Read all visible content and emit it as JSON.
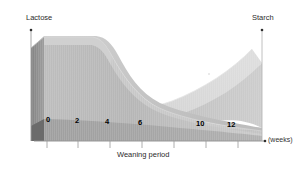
{
  "chart_data": {
    "type": "area",
    "title": "",
    "subtitle": "",
    "xlabel": "Weaning period",
    "xunit": "(weeks)",
    "ylabel_left": "Lactose",
    "ylabel_right": "Starch",
    "grid": false,
    "legend_position": "none",
    "xlim": [
      0,
      14
    ],
    "ylim": [
      0,
      100
    ],
    "x_ticks": [
      0,
      2,
      4,
      6,
      10,
      12
    ],
    "x_tick_labels": [
      "0",
      "2",
      "4",
      "6",
      "10",
      "12"
    ],
    "series": [
      {
        "name": "Lactose",
        "axis": "left",
        "x": [
          0,
          1,
          2,
          3,
          4,
          5,
          6,
          7,
          8,
          9,
          10,
          11,
          12,
          13,
          14
        ],
        "values": [
          100,
          100,
          98,
          95,
          88,
          72,
          55,
          42,
          33,
          26,
          20,
          15,
          11,
          8,
          5
        ]
      },
      {
        "name": "Starch",
        "axis": "right",
        "x": [
          0,
          1,
          2,
          3,
          4,
          5,
          6,
          7,
          8,
          9,
          10,
          11,
          12,
          13,
          14
        ],
        "values": [
          2,
          3,
          4,
          6,
          8,
          11,
          15,
          20,
          27,
          36,
          47,
          60,
          74,
          88,
          100
        ]
      }
    ],
    "annotations": []
  },
  "axes": {
    "left_title": "Lactose",
    "right_title": "Starch",
    "x_title": "Weaning period",
    "x_unit": "(weeks)"
  },
  "ticks": [
    {
      "label": "0",
      "left": 46,
      "top": 116
    },
    {
      "label": "2",
      "left": 75,
      "top": 117
    },
    {
      "label": "4",
      "left": 105,
      "top": 118
    },
    {
      "label": "6",
      "left": 138,
      "top": 119
    },
    {
      "label": "10",
      "left": 196,
      "top": 120
    },
    {
      "label": "12",
      "left": 227,
      "top": 121
    }
  ],
  "colors": {
    "background": "#ffffff",
    "axis_line": "#8a8a8a",
    "lactose_top": "#c9c9c9",
    "lactose_front": "#b4b4b4",
    "lactose_side": "#8e8e8e",
    "starch_top": "#d8d8d8",
    "starch_front": "#c2c2c2",
    "floor": "#a6a6a6",
    "floor_dark": "#9a9a9a",
    "text": "#1a1a1a"
  }
}
